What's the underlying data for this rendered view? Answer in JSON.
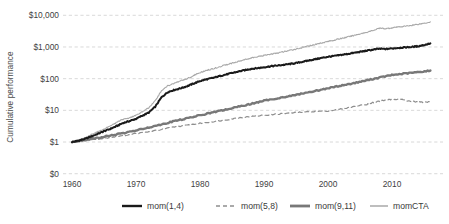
{
  "chart_data": {
    "type": "line",
    "title": "",
    "xlabel": "",
    "ylabel": "Cumulative performance",
    "y_scale": "log",
    "grid": true,
    "legend_position": "bottom",
    "x_ticks": [
      "1960",
      "1970",
      "1980",
      "1990",
      "2000",
      "2010"
    ],
    "x_tick_values": [
      1960,
      1970,
      1980,
      1990,
      2000,
      2010
    ],
    "y_ticks": [
      "$0",
      "$1",
      "$10",
      "$100",
      "$1,000",
      "$10,000"
    ],
    "y_tick_values": [
      0.1,
      1,
      10,
      100,
      1000,
      10000
    ],
    "ylim": [
      0.1,
      10000
    ],
    "xlim": [
      1960,
      2016
    ],
    "series": [
      {
        "name": "mom(1,4)",
        "color": "#1a1a1a",
        "width": 2.0,
        "dash": "none",
        "x": [
          1960,
          1961,
          1962,
          1963,
          1964,
          1965,
          1966,
          1967,
          1968,
          1969,
          1970,
          1971,
          1972,
          1973,
          1974,
          1975,
          1976,
          1977,
          1978,
          1979,
          1980,
          1981,
          1982,
          1983,
          1984,
          1985,
          1986,
          1987,
          1988,
          1989,
          1990,
          1991,
          1992,
          1993,
          1994,
          1995,
          1996,
          1997,
          1998,
          1999,
          2000,
          2001,
          2002,
          2003,
          2004,
          2005,
          2006,
          2007,
          2008,
          2009,
          2010,
          2011,
          2012,
          2013,
          2014,
          2015,
          2016
        ],
        "y": [
          1.0,
          1.1,
          1.25,
          1.5,
          1.8,
          2.2,
          2.6,
          3.2,
          4.0,
          4.6,
          5.4,
          6.8,
          8.5,
          13.0,
          26.0,
          38.0,
          44.0,
          50.0,
          58.0,
          70.0,
          84.0,
          95.0,
          105.0,
          120.0,
          135.0,
          150.0,
          168.0,
          185.0,
          205.0,
          215.0,
          230.0,
          245.0,
          258.0,
          272.0,
          290.0,
          310.0,
          340.0,
          375.0,
          410.0,
          450.0,
          490.0,
          520.0,
          560.0,
          600.0,
          650.0,
          700.0,
          760.0,
          820.0,
          880.0,
          860.0,
          900.0,
          940.0,
          970.0,
          1000.0,
          1050.0,
          1150.0,
          1300.0
        ]
      },
      {
        "name": "mom(5,8)",
        "color": "#8e8e8e",
        "width": 1.2,
        "dash": "4 3",
        "x": [
          1960,
          1962,
          1964,
          1966,
          1968,
          1970,
          1972,
          1974,
          1976,
          1978,
          1980,
          1982,
          1984,
          1986,
          1988,
          1990,
          1992,
          1994,
          1996,
          1998,
          2000,
          2002,
          2004,
          2006,
          2007,
          2008,
          2009,
          2010,
          2011,
          2012,
          2013,
          2014,
          2015,
          2016
        ],
        "y": [
          1.0,
          1.1,
          1.25,
          1.4,
          1.6,
          1.85,
          2.1,
          2.5,
          3.0,
          3.4,
          3.9,
          4.4,
          5.0,
          5.8,
          6.4,
          7.0,
          7.6,
          8.2,
          8.8,
          9.2,
          9.6,
          11.0,
          13.0,
          15.5,
          17.5,
          19.5,
          21.0,
          22.0,
          23.0,
          21.0,
          19.0,
          18.5,
          18.0,
          18.5
        ]
      },
      {
        "name": "mom(9,11)",
        "color": "#787878",
        "width": 2.4,
        "dash": "none",
        "x": [
          1960,
          1962,
          1964,
          1966,
          1968,
          1970,
          1972,
          1974,
          1976,
          1978,
          1980,
          1982,
          1984,
          1986,
          1988,
          1990,
          1992,
          1994,
          1996,
          1998,
          2000,
          2002,
          2004,
          2006,
          2008,
          2010,
          2012,
          2014,
          2016
        ],
        "y": [
          1.0,
          1.15,
          1.35,
          1.6,
          1.9,
          2.3,
          2.9,
          3.6,
          4.6,
          5.6,
          7.0,
          8.6,
          10.5,
          13.0,
          16.0,
          20.0,
          24.0,
          28.0,
          34.0,
          41.0,
          50.0,
          60.0,
          72.0,
          88.0,
          108.0,
          130.0,
          145.0,
          160.0,
          180.0
        ]
      },
      {
        "name": "momCTA",
        "color": "#a8a8a8",
        "width": 1.1,
        "dash": "none",
        "x": [
          1960,
          1961,
          1962,
          1963,
          1964,
          1965,
          1966,
          1967,
          1968,
          1969,
          1970,
          1971,
          1972,
          1973,
          1974,
          1975,
          1976,
          1977,
          1978,
          1979,
          1980,
          1981,
          1982,
          1983,
          1984,
          1985,
          1986,
          1987,
          1988,
          1989,
          1990,
          1991,
          1992,
          1993,
          1994,
          1995,
          1996,
          1997,
          1998,
          1999,
          2000,
          2001,
          2002,
          2003,
          2004,
          2005,
          2006,
          2007,
          2008,
          2009,
          2010,
          2011,
          2012,
          2013,
          2014,
          2015,
          2016
        ],
        "y": [
          1.0,
          1.15,
          1.35,
          1.7,
          2.1,
          2.6,
          3.2,
          4.2,
          5.2,
          5.8,
          7.0,
          9.0,
          12.0,
          20.0,
          42.0,
          60.0,
          72.0,
          85.0,
          100.0,
          125.0,
          155.0,
          180.0,
          205.0,
          235.0,
          270.0,
          310.0,
          350.0,
          400.0,
          450.0,
          490.0,
          540.0,
          590.0,
          640.0,
          700.0,
          780.0,
          860.0,
          960.0,
          1080.0,
          1200.0,
          1350.0,
          1500.0,
          1650.0,
          1850.0,
          2050.0,
          2300.0,
          2600.0,
          2900.0,
          3300.0,
          3900.0,
          3800.0,
          4000.0,
          4300.0,
          4500.0,
          4800.0,
          5200.0,
          5600.0,
          6200.0
        ]
      }
    ]
  },
  "legend": {
    "items": [
      {
        "label": "mom(1,4)"
      },
      {
        "label": "mom(5,8)"
      },
      {
        "label": "mom(9,11)"
      },
      {
        "label": "momCTA"
      }
    ]
  }
}
